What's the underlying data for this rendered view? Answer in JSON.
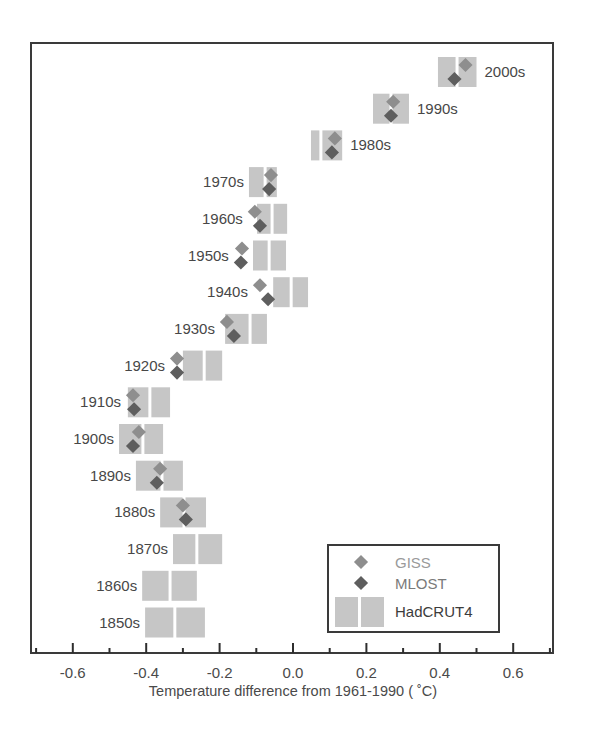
{
  "chart_data": {
    "type": "scatter",
    "title": "",
    "xlabel": "Temperature difference from 1961-1990 ( ˚C)",
    "ylabel": "",
    "xlim": [
      -0.7,
      0.7
    ],
    "x_ticks": [
      -0.6,
      -0.4,
      -0.2,
      0.0,
      0.2,
      0.4,
      0.6
    ],
    "x_tick_labels": [
      "-0.6",
      "-0.4",
      "-0.2",
      "0.0",
      "0.2",
      "0.4",
      "0.6"
    ],
    "x_minor_ticks": [
      -0.7,
      -0.5,
      -0.3,
      -0.1,
      0.1,
      0.3,
      0.5,
      0.7
    ],
    "grid": false,
    "legend_position": "lower right",
    "categories": [
      "2000s",
      "1990s",
      "1980s",
      "1970s",
      "1960s",
      "1950s",
      "1940s",
      "1930s",
      "1920s",
      "1910s",
      "1900s",
      "1890s",
      "1880s",
      "1870s",
      "1860s",
      "1850s"
    ],
    "series": [
      {
        "name": "GISS",
        "marker": "diamond",
        "color": "#8e8e8e",
        "values": [
          0.47,
          0.273,
          0.114,
          -0.06,
          -0.104,
          -0.139,
          -0.09,
          -0.18,
          -0.316,
          -0.436,
          -0.42,
          -0.362,
          -0.3,
          null,
          null,
          null
        ]
      },
      {
        "name": "MLOST",
        "marker": "diamond",
        "color": "#5e5e5e",
        "values": [
          0.44,
          0.267,
          0.106,
          -0.065,
          -0.09,
          -0.142,
          -0.068,
          -0.161,
          -0.316,
          -0.433,
          -0.436,
          -0.371,
          -0.292,
          null,
          null,
          null
        ]
      },
      {
        "name": "HadCRUT4",
        "marker": "uncertainty-box",
        "color": "#c6c6c6",
        "values": [
          0.447,
          0.267,
          0.076,
          -0.076,
          -0.057,
          -0.065,
          -0.005,
          -0.117,
          -0.242,
          -0.39,
          -0.409,
          -0.357,
          -0.297,
          -0.262,
          -0.335,
          -0.322
        ],
        "lower": [
          0.395,
          0.218,
          0.049,
          -0.12,
          -0.098,
          -0.109,
          -0.054,
          -0.185,
          -0.3,
          -0.45,
          -0.474,
          -0.428,
          -0.362,
          -0.327,
          -0.411,
          -0.403
        ],
        "upper": [
          0.5,
          0.316,
          0.134,
          -0.044,
          -0.016,
          -0.019,
          0.041,
          -0.071,
          -0.193,
          -0.335,
          -0.354,
          -0.3,
          -0.237,
          -0.193,
          -0.262,
          -0.24
        ]
      }
    ],
    "label_side": [
      "right",
      "right",
      "right",
      "left",
      "left",
      "left",
      "left",
      "left",
      "left",
      "left",
      "left",
      "left",
      "left",
      "left",
      "left",
      "left"
    ]
  },
  "legend": {
    "items": [
      {
        "label": "GISS",
        "text_color": "#9a9a9a"
      },
      {
        "label": "MLOST",
        "text_color": "#7a7a7a"
      },
      {
        "label": "HadCRUT4",
        "text_color": "#3c3c3c"
      }
    ]
  },
  "colors": {
    "frame": "#3a3a3a",
    "box": "#c6c6c6",
    "giss": "#8e8e8e",
    "mlost": "#5e5e5e"
  }
}
